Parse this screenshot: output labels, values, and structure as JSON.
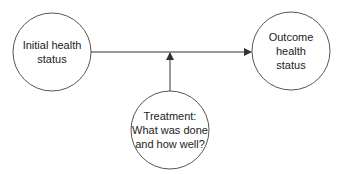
{
  "diagram": {
    "type": "flow",
    "colors": {
      "stroke": "#555555",
      "text": "#222222",
      "background": "#ffffff"
    },
    "nodes": [
      {
        "id": "initial",
        "shape": "circle",
        "lines": [
          "Initial health",
          "status"
        ]
      },
      {
        "id": "outcome",
        "shape": "circle",
        "lines": [
          "Outcome",
          "health",
          "status"
        ]
      },
      {
        "id": "treatment",
        "shape": "circle",
        "lines": [
          "Treatment:",
          "What was done",
          "and how well?"
        ]
      }
    ],
    "edges": [
      {
        "from": "initial",
        "to": "outcome",
        "style": "arrow"
      },
      {
        "from": "treatment",
        "to": "initial-outcome-edge",
        "style": "arrow"
      }
    ]
  }
}
